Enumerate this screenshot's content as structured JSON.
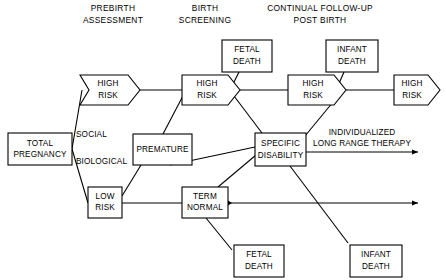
{
  "diagram": {
    "background_color": "#ffffff",
    "line_color": "#000000",
    "headers": [
      {
        "id": "header-prebirth",
        "line1": "PREBIRTH",
        "line2": "ASSESSMENT"
      },
      {
        "id": "header-birth",
        "line1": "BIRTH",
        "line2": "SCREENING"
      },
      {
        "id": "header-followup",
        "line1": "CONTINUAL FOLLOW-UP",
        "line2": "POST BIRTH"
      }
    ],
    "nodes": {
      "total_pregnancy": {
        "line1": "TOTAL",
        "line2": "PREGNANCY",
        "shape": "rectangle"
      },
      "high_risk_1": {
        "line1": "HIGH",
        "line2": "RISK",
        "shape": "chevron"
      },
      "high_risk_2": {
        "line1": "HIGH",
        "line2": "RISK",
        "shape": "arrow-right"
      },
      "high_risk_3": {
        "line1": "HIGH",
        "line2": "RISK",
        "shape": "arrow-right"
      },
      "high_risk_4": {
        "line1": "HIGH",
        "line2": "RISK",
        "shape": "arrow-right"
      },
      "low_risk": {
        "line1": "LOW",
        "line2": "RISK",
        "shape": "rectangle"
      },
      "premature": {
        "line1": "PREMATURE",
        "line2": "",
        "shape": "rectangle"
      },
      "term_normal": {
        "line1": "TERM",
        "line2": "NORMAL",
        "shape": "rectangle"
      },
      "specific_disability": {
        "line1": "SPECIFIC",
        "line2": "DISABILITY",
        "shape": "rectangle"
      },
      "fetal_death_top": {
        "line1": "FETAL",
        "line2": "DEATH",
        "shape": "rectangle"
      },
      "fetal_death_bottom": {
        "line1": "FETAL",
        "line2": "DEATH",
        "shape": "rectangle"
      },
      "infant_death_top": {
        "line1": "INFANT",
        "line2": "DEATH",
        "shape": "rectangle"
      },
      "infant_death_bottom": {
        "line1": "INFANT",
        "line2": "DEATH",
        "shape": "rectangle"
      }
    },
    "edge_labels": {
      "social": "SOCIAL",
      "biological": "BIOLOGICAL"
    },
    "outcome_label": {
      "line1": "INDIVIDUALIZED",
      "line2": "LONG RANGE THERAPY"
    }
  }
}
